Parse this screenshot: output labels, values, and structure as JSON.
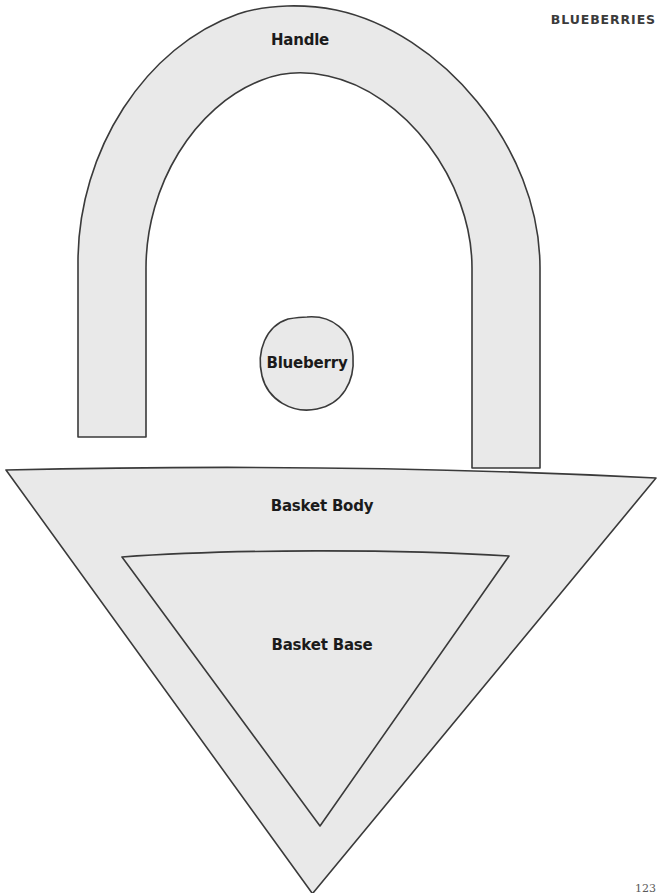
{
  "page": {
    "chapter_title": "BLUEBERRIES",
    "page_number": "123",
    "background_color": "#ffffff"
  },
  "style": {
    "piece_fill": "#e9e9e9",
    "piece_stroke": "#3a3a3a",
    "label_color": "#1b1b1b",
    "chapter_title_color": "#3b3b3b"
  },
  "pattern": {
    "name": "Blueberry Basket Applique Pattern",
    "pieces": [
      {
        "id": "handle",
        "label": "Handle",
        "shape": "arch-band",
        "label_x": 300,
        "label_y": 40
      },
      {
        "id": "blueberry",
        "label": "Blueberry",
        "shape": "circle-blob",
        "label_x": 307,
        "label_y": 363
      },
      {
        "id": "basket-body",
        "label": "Basket Body",
        "shape": "inverted-triangle",
        "label_x": 322,
        "label_y": 506
      },
      {
        "id": "basket-base",
        "label": "Basket Base",
        "shape": "inverted-triangle-inner",
        "label_x": 322,
        "label_y": 645
      }
    ]
  }
}
